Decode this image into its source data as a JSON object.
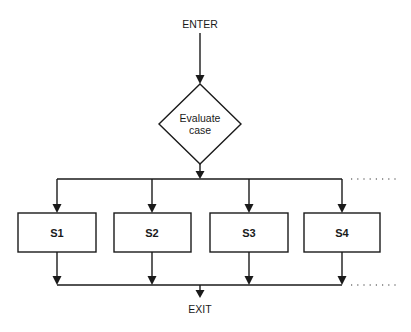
{
  "diagram": {
    "type": "flowchart",
    "entry_label": "ENTER",
    "decision_label_line1": "Evaluate",
    "decision_label_line2": "case",
    "branches": [
      {
        "label": "S1"
      },
      {
        "label": "S2"
      },
      {
        "label": "S3"
      },
      {
        "label": "S4"
      }
    ],
    "continuation": "more branches (dotted)",
    "exit_label": "EXIT"
  }
}
